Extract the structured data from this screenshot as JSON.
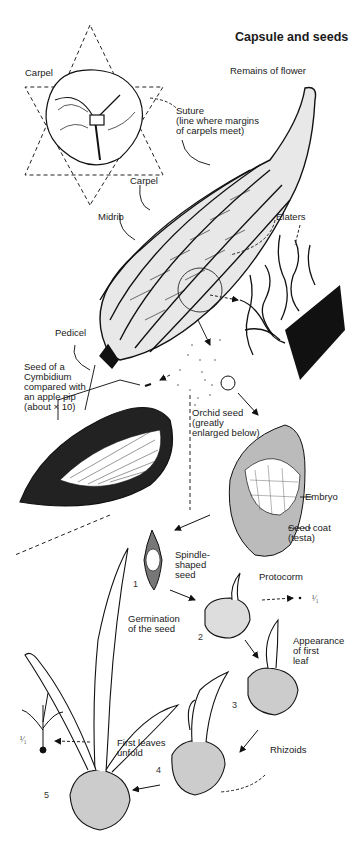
{
  "title": "Capsule and seeds",
  "labels": {
    "carpel_top": "Carpel",
    "remains_of_flower": "Remains of flower",
    "suture": "Suture\n(line where margins\nof carpels meet)",
    "carpel_mid": "Carpel",
    "midrib": "Midrib",
    "elaters": "Elaters",
    "pedicel": "Pedicel",
    "seed_compare": "Seed of a\nCymbidium\ncompared with\nan apple pip\n(about × 10)",
    "orchid_seed": "Orchid seed\n(greatly\nenlarged below)",
    "embryo": "Embryo",
    "seed_coat": "Seed coat\n(testa)",
    "spindle_seed": "Spindle-\nshaped\nseed",
    "protocorm": "Protocorm",
    "germination": "Germination\nof the seed",
    "first_leaf": "Appearance\nof first\nleaf",
    "rhizoids": "Rhizoids",
    "first_leaves": "First leaves\nunfold"
  },
  "stages": [
    "1",
    "2",
    "3",
    "4",
    "5"
  ],
  "scales": {
    "protocorm": "¹⁄₁",
    "seedling": "¹⁄₁"
  },
  "colors": {
    "ink": "#111111",
    "paper": "#ffffff"
  }
}
